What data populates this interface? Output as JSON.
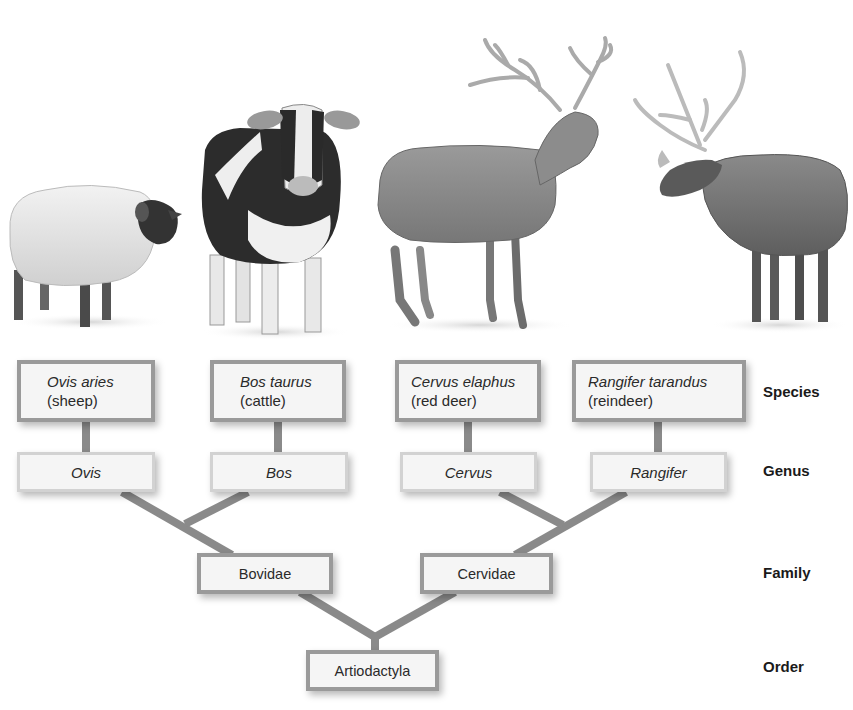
{
  "diagram": {
    "type": "taxonomic-hierarchy",
    "colors": {
      "connector": "#8a8a8a",
      "box_border_strong": "#9a9a9a",
      "box_border_light": "#d2d2d2",
      "box_fill": "#f5f5f5",
      "label_text": "#1a1a1a"
    },
    "animals": [
      {
        "id": "sheep",
        "illustration": "sheep-illustration"
      },
      {
        "id": "cattle",
        "illustration": "cow-illustration"
      },
      {
        "id": "red-deer",
        "illustration": "red-deer-illustration"
      },
      {
        "id": "reindeer",
        "illustration": "reindeer-illustration"
      }
    ],
    "species": [
      {
        "scientific": "Ovis aries",
        "common": "(sheep)"
      },
      {
        "scientific": "Bos taurus",
        "common": "(cattle)"
      },
      {
        "scientific": "Cervus elaphus",
        "common": "(red deer)"
      },
      {
        "scientific": "Rangifer tarandus",
        "common": "(reindeer)"
      }
    ],
    "genus": [
      "Ovis",
      "Bos",
      "Cervus",
      "Rangifer"
    ],
    "family": [
      "Bovidae",
      "Cervidae"
    ],
    "order": "Artiodactyla",
    "ranks": {
      "species": "Species",
      "genus": "Genus",
      "family": "Family",
      "order": "Order"
    }
  }
}
